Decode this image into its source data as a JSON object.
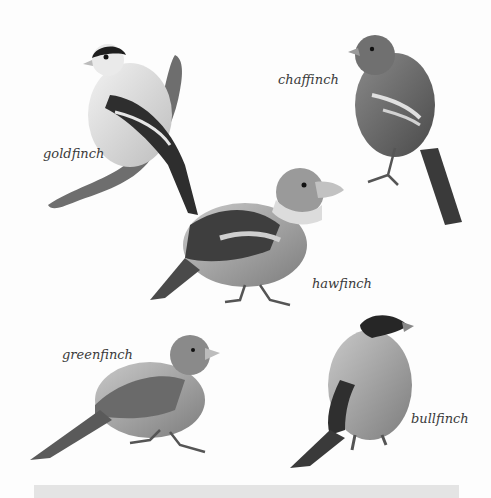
{
  "illustration": {
    "background": "#fdfdfd",
    "birds": [
      {
        "id": "goldfinch",
        "label": "goldfinch"
      },
      {
        "id": "chaffinch",
        "label": "chaffinch"
      },
      {
        "id": "hawfinch",
        "label": "hawfinch"
      },
      {
        "id": "greenfinch",
        "label": "greenfinch"
      },
      {
        "id": "bullfinch",
        "label": "bullfinch"
      }
    ]
  }
}
